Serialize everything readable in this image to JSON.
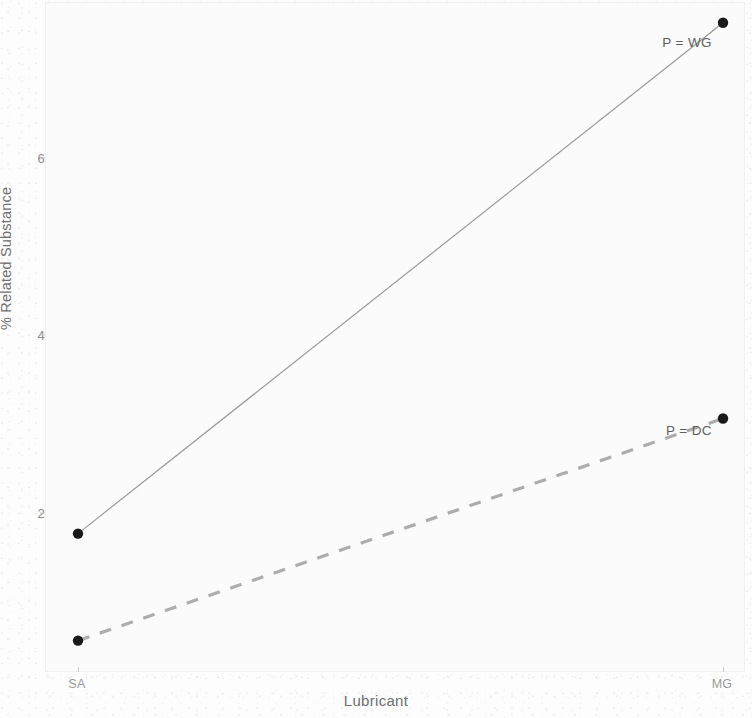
{
  "figure": {
    "background_color": "#fdfdfd",
    "panel_color": "#fbfbfb"
  },
  "axes": {
    "y_title": "% Related Substance",
    "x_title": "Lubricant",
    "y_ticks": [
      "2",
      "4",
      "6"
    ],
    "x_ticks": [
      "SA",
      "MG"
    ]
  },
  "annotations": {
    "wg_label": "P = WG",
    "dc_label": "P = DC"
  },
  "chart_data": {
    "type": "line",
    "title": "",
    "subtitle": "",
    "xlabel": "Lubricant",
    "ylabel": "% Related Substance",
    "categories": [
      "SA",
      "MG"
    ],
    "series": [
      {
        "name": "P = WG",
        "label": "P = WG",
        "values": [
          1.65,
          7.33
        ],
        "linestyle": "solid",
        "color": "#9a9a9a",
        "marker": "circle",
        "marker_color": "#1a1a1a"
      },
      {
        "name": "P = DC",
        "label": "P = DC",
        "values": [
          0.46,
          2.93
        ],
        "linestyle": "dashed",
        "color": "#adadad",
        "marker": "circle",
        "marker_color": "#1a1a1a"
      }
    ],
    "y_ticks": [
      2,
      4,
      6
    ],
    "ylim": [
      0.1,
      7.55
    ],
    "xlim": [
      "SA",
      "MG"
    ],
    "grid": false,
    "legend": "inline-annotations",
    "legend_position": "right-of-endpoint"
  }
}
